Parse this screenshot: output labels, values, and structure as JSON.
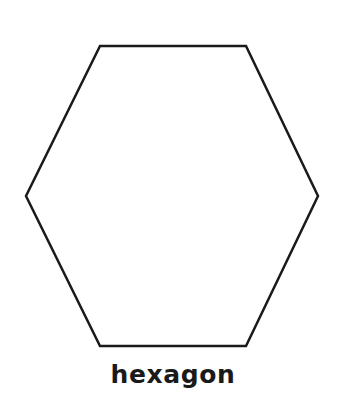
{
  "diagram": {
    "shape": {
      "name": "hexagon",
      "vertices": [
        [
          100,
          46
        ],
        [
          246,
          46
        ],
        [
          318,
          196
        ],
        [
          246,
          346
        ],
        [
          100,
          346
        ],
        [
          26,
          196
        ]
      ],
      "stroke_color": "#1a1a1a",
      "stroke_width": 2.5,
      "fill_color": "#ffffff"
    },
    "label": "hexagon"
  }
}
